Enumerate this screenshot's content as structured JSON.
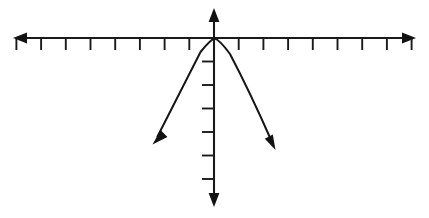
{
  "figure": {
    "background_color": "#ffffff",
    "ink_color": "#1a1a1a",
    "width": 429,
    "height": 218
  },
  "chart_data": {
    "type": "line",
    "title": "",
    "subtitle": "",
    "xlabel": "",
    "ylabel": "",
    "grid": false,
    "legend": null,
    "annotations": [],
    "axes": {
      "x_axis": {
        "name": "x-axis",
        "orientation": "horizontal",
        "pixel_y": 38,
        "pixel_x_start": 13,
        "pixel_x_end": 416,
        "arrow_both_ends": true,
        "tick_count_left": 8,
        "tick_count_right": 8,
        "tick_spacing_px": 24.7,
        "tick_length_px": 12,
        "tick_direction": "down",
        "tick_labels": [],
        "xlim": [
          -8.2,
          8.2
        ]
      },
      "y_axis": {
        "name": "y-axis",
        "orientation": "vertical",
        "pixel_x": 214,
        "pixel_y_start": 8,
        "pixel_y_end": 207,
        "arrow_both_ends": true,
        "tick_count_above_origin": 0,
        "tick_count_below_origin": 6,
        "tick_spacing_px": 23.5,
        "tick_length_px": 12,
        "tick_direction": "left",
        "tick_labels": [],
        "ylim": [
          -7.2,
          1.3
        ]
      },
      "origin_px": [
        214,
        38
      ]
    },
    "series": [
      {
        "name": "parabola",
        "shape": "parabola",
        "opens": "down",
        "vertex": [
          0,
          0
        ],
        "vertex_px": [
          214,
          38
        ],
        "equation": "y = -a x^2",
        "x": [
          -2.5,
          -2.0,
          -1.5,
          -1.0,
          -0.5,
          0,
          0.5,
          1.0,
          1.5,
          2.0,
          2.5
        ],
        "values": [
          -4.5,
          -2.9,
          -1.6,
          -0.72,
          -0.18,
          0,
          -0.18,
          -0.72,
          -1.6,
          -2.9,
          -4.5
        ],
        "left_endpoint_px": [
          153,
          143
        ],
        "right_endpoint_px": [
          275,
          148
        ],
        "left_arrow": true,
        "right_arrow": true,
        "color": "#151515",
        "stroke_width": 2
      }
    ]
  },
  "geometry": {
    "x_axis_path": "M 22 38 L 408 38",
    "y_axis_path": "M 214 17 L 214 198",
    "x_ticks_left_px": [
      189.3,
      164.6,
      139.9,
      115.2,
      90.5,
      65.8,
      41.1,
      16.4
    ],
    "x_ticks_right_px": [
      238.7,
      263.4,
      288.1,
      312.8,
      337.5,
      362.2,
      386.9,
      411.6
    ],
    "y_ticks_below_px": [
      61.5,
      85,
      108.5,
      132,
      155.5,
      179
    ],
    "curve_path": "M 157.5 136.5 Q 180 92 200.5 52 Q 210 40.2 214.5 38.4 Q 220 40.2 230 54 Q 250 92 271.5 141",
    "arrow_left_axis": "M 13 38 L 27 32.6 L 27 43.4 Z",
    "arrow_right_axis": "M 416 38 L 402 32.6 L 402 43.4 Z",
    "arrow_top_axis": "M 214 8 L 208.6 22 L 219.4 22 Z",
    "arrow_bottom_axis": "M 214 207 L 208.6 193 L 219.4 193 Z",
    "arrow_curve_left": "M 152.5 144.5 L 167.4 136.9 L 160.6 130.1 Z",
    "arrow_curve_right": "M 275.5 150 L 264.8 138.8 L 272.8 134.6 Z"
  }
}
